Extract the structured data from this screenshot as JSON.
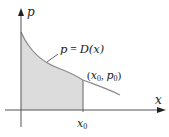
{
  "diagram": {
    "type": "demand-curve-consumer-surplus",
    "axes": {
      "x_label": "x",
      "y_label": "p"
    },
    "curve": {
      "label_lhs": "p",
      "label_eq": " = ",
      "label_rhs": "D(x)",
      "description": "Decreasing demand curve p = D(x)"
    },
    "point": {
      "label_open": "(",
      "x_sym": "x",
      "x_sub": "0",
      "sep": ", ",
      "p_sym": "p",
      "p_sub": "0",
      "label_close": ")"
    },
    "tick": {
      "sym": "x",
      "sub": "0"
    },
    "shaded_region": {
      "description": "Area under demand curve from 0 to x0",
      "fill": "#d9d9d9"
    },
    "colors": {
      "axis": "#333333",
      "curve": "#8a8a8a",
      "fill": "#dcdcdc",
      "text": "#222222"
    }
  }
}
